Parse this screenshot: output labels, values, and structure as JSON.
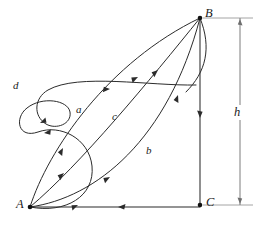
{
  "figure": {
    "vertices": [
      {
        "id": "A",
        "label": "A",
        "x": 30,
        "y": 207,
        "label_x": 16,
        "label_y": 200
      },
      {
        "id": "B",
        "label": "B",
        "x": 200,
        "y": 18,
        "label_x": 205,
        "label_y": 9
      },
      {
        "id": "C",
        "label": "C",
        "x": 200,
        "y": 205,
        "label_x": 206,
        "label_y": 198
      }
    ],
    "path_labels": [
      {
        "id": "a",
        "label": "a",
        "x": 76,
        "y": 106
      },
      {
        "id": "b",
        "label": "b",
        "x": 146,
        "y": 147
      },
      {
        "id": "c",
        "label": "c",
        "x": 112,
        "y": 113
      },
      {
        "id": "d",
        "label": "d",
        "x": 14,
        "y": 82
      }
    ],
    "dimension": {
      "id": "h",
      "label": "h",
      "label_x": 234,
      "label_y": 107,
      "line_x": 240,
      "top_y": 18,
      "bottom_y": 205,
      "ext_top_y": 18,
      "ext_bottom_y": 205
    },
    "edges": [
      {
        "id": "BC",
        "from": "B",
        "to": "C",
        "arrow": "down"
      },
      {
        "id": "CA",
        "from": "C",
        "to": "A",
        "arrow": "left"
      }
    ],
    "colors": {
      "stroke": "#2b2b2b",
      "dimension": "#6e6e6e",
      "extension": "#9a9a9a",
      "background": "#ffffff",
      "text": "#1a1a1a"
    }
  }
}
